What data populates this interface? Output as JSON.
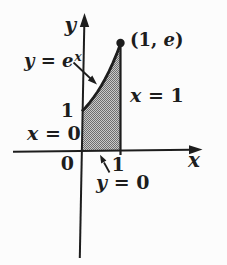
{
  "figure": {
    "colors": {
      "background": "#fcfcfc",
      "ink": "#1d1d1d",
      "shade_dark": "#6e6e6e",
      "shade_light": "#c9c9c9"
    },
    "axis": {
      "y_label": "y",
      "x_label": "x"
    },
    "curve_label": {
      "var": "y",
      "eq": " = ",
      "base": "e",
      "sup": "x"
    },
    "point_label": {
      "pre": "(1, ",
      "e": "e",
      "post": ")"
    },
    "boundary_labels": {
      "right": {
        "var": "x",
        "eq": " = 1"
      },
      "left": {
        "var": "x",
        "eq": " = 0"
      },
      "bottom": {
        "var": "y",
        "eq": " = 0"
      }
    },
    "ticks": {
      "origin": "0",
      "y_1": "1",
      "x_1": "1"
    }
  },
  "chart_data": {
    "type": "line",
    "xlabel": "x",
    "ylabel": "y",
    "xlim": [
      -1.8,
      3.1
    ],
    "ylim": [
      -2.7,
      3.4
    ],
    "grid": false,
    "legend": "none",
    "series": [
      {
        "name": "y = e^x",
        "x": [
          0,
          0.1,
          0.2,
          0.3,
          0.4,
          0.5,
          0.6,
          0.7,
          0.8,
          0.9,
          1.0
        ],
        "y": [
          1,
          1.105,
          1.221,
          1.35,
          1.492,
          1.649,
          1.822,
          2.014,
          2.226,
          2.46,
          2.718
        ]
      }
    ],
    "key_point": {
      "x": 1,
      "y": 2.718,
      "label": "(1, e)"
    },
    "shaded_region": {
      "bounds": [
        "y = e^x",
        "x = 0",
        "x = 1",
        "y = 0"
      ],
      "fill": "gray halftone stipple"
    },
    "annotations": [
      "y = e^x",
      "(1, e)",
      "x = 1",
      "x = 0",
      "y = 0",
      "0",
      "1",
      "1"
    ]
  }
}
